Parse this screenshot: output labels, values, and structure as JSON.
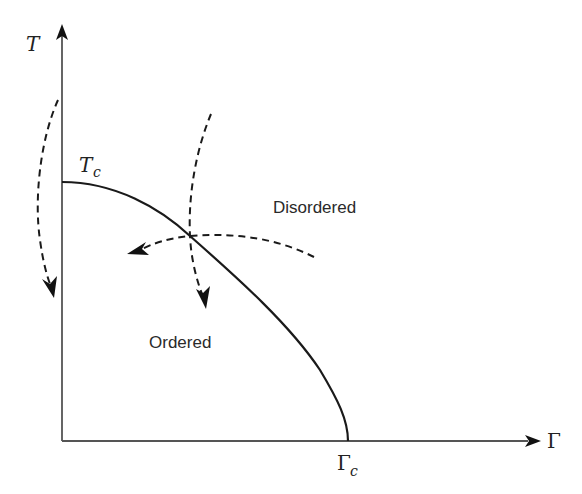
{
  "diagram": {
    "type": "phase-diagram",
    "axes": {
      "y_label": "T",
      "x_label": "Γ"
    },
    "critical_points": {
      "temperature": {
        "symbol": "T",
        "subscript": "c"
      },
      "field": {
        "symbol": "Γ",
        "subscript": "c"
      }
    },
    "regions": {
      "upper": "Disordered",
      "lower": "Ordered"
    },
    "phase_boundary": {
      "from": "T_c on T axis",
      "to": "Γ_c on Γ axis",
      "style": "solid"
    },
    "paths": [
      {
        "name": "thermal-quench-at-zero-field",
        "style": "dashed",
        "direction": "downward along T axis"
      },
      {
        "name": "temperature-quench-path",
        "style": "dashed",
        "direction": "downward across boundary"
      },
      {
        "name": "field-quench-path",
        "style": "dashed",
        "direction": "leftward across boundary"
      }
    ],
    "colors": {
      "lines": "#1a1a1a",
      "axes": "#555555",
      "background": "#ffffff"
    }
  }
}
